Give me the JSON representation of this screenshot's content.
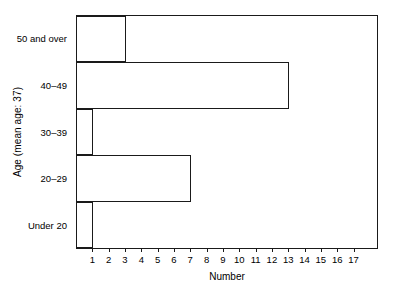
{
  "chart_data": {
    "type": "bar",
    "orientation": "horizontal",
    "title": "",
    "xlabel": "Number",
    "ylabel": "Age (mean age: 37)",
    "categories": [
      "Under 20",
      "20–29",
      "30–39",
      "40–49",
      "50 and over"
    ],
    "values": [
      1,
      7,
      1,
      13,
      3
    ],
    "xlim": [
      0,
      18.5
    ],
    "ylim": [
      0,
      5
    ],
    "xticks": [
      1,
      2,
      3,
      4,
      5,
      6,
      7,
      8,
      9,
      10,
      11,
      12,
      13,
      14,
      15,
      16,
      17
    ],
    "xticklabels": [
      "1",
      "2",
      "3",
      "4",
      "5",
      "6",
      "7",
      "8",
      "9",
      "10",
      "11",
      "12",
      "13",
      "14",
      "15",
      "16",
      "17"
    ],
    "grid": false,
    "legend": null,
    "bar_fill_color": "#ffffff",
    "bar_edge_color": "#1a1a1a",
    "axis_color": "#1a1a1a",
    "background_color": "#ffffff"
  }
}
